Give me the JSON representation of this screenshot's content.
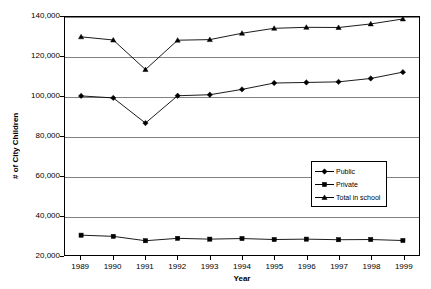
{
  "chart_data": {
    "type": "line",
    "title": "",
    "xlabel": "Year",
    "ylabel": "# of City Children",
    "categories": [
      "1989",
      "1990",
      "1991",
      "1992",
      "1993",
      "1994",
      "1995",
      "1996",
      "1997",
      "1998",
      "1999"
    ],
    "x": [
      1989,
      1990,
      1991,
      1992,
      1993,
      1994,
      1995,
      1996,
      1997,
      1998,
      1999
    ],
    "ylim": [
      20000,
      140000
    ],
    "ytick_labels": [
      "140,000",
      "120,000",
      "100,000",
      "80,000",
      "60,000",
      "40,000",
      "20,000"
    ],
    "ytick_values": [
      140000,
      120000,
      100000,
      80000,
      60000,
      40000,
      20000
    ],
    "grid": true,
    "legend_position": "center-right",
    "series": [
      {
        "name": "Public",
        "marker": "diamond",
        "color": "#000000",
        "values": [
          100200,
          99200,
          86500,
          100300,
          100800,
          103500,
          106700,
          107000,
          107300,
          109000,
          112200
        ]
      },
      {
        "name": "Private",
        "marker": "square",
        "color": "#000000",
        "values": [
          30000,
          29400,
          27200,
          28400,
          28000,
          28300,
          27800,
          28000,
          27700,
          27800,
          27300
        ]
      },
      {
        "name": "Total in school",
        "marker": "triangle",
        "color": "#000000",
        "values": [
          130000,
          128400,
          113500,
          128300,
          128600,
          131800,
          134300,
          134800,
          134700,
          136500,
          139000
        ]
      }
    ]
  },
  "legend": {
    "items": [
      {
        "label": "Public"
      },
      {
        "label": "Private"
      },
      {
        "label": "Total in school"
      }
    ]
  },
  "axes": {
    "y_title": "# of City Children",
    "x_title": "Year"
  }
}
